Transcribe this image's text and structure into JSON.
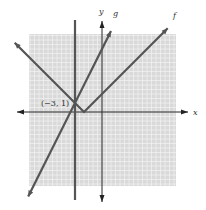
{
  "chart_data": {
    "type": "line",
    "title": "",
    "xlabel": "x",
    "ylabel": "y",
    "xlim": [
      -8,
      8
    ],
    "ylim": [
      -8,
      8
    ],
    "grid": true,
    "series": [
      {
        "name": "f",
        "expression": "|x + 2|",
        "kind": "absolute-value",
        "vertex": [
          -2,
          0
        ],
        "slopes": [
          -1,
          1
        ],
        "color": "#555555"
      },
      {
        "name": "g",
        "expression": "2x + 7",
        "kind": "line",
        "slope": 2,
        "intercept": 7,
        "color": "#555555"
      },
      {
        "name": "vertical",
        "expression": "x = -3",
        "kind": "vertical-line",
        "x": -3,
        "color": "#555555"
      }
    ],
    "annotations": [
      {
        "text": "(−3, 1)",
        "point": [
          -3,
          1
        ]
      }
    ],
    "labels": {
      "x_axis": "x",
      "y_axis": "y",
      "f": "f",
      "g": "g"
    }
  },
  "colors": {
    "grid_bg": "#d9d9d9",
    "grid_line": "#f2f2f2",
    "curve": "#555555",
    "axis": "#222222"
  }
}
